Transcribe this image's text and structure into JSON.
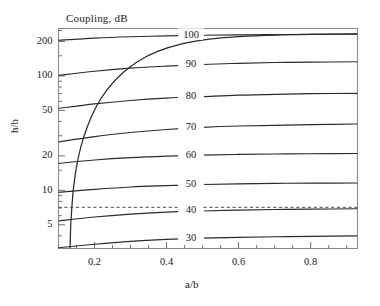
{
  "chart_data": {
    "type": "line",
    "title": "Coupling, dB",
    "xlabel": "a/b",
    "ylabel": "h/b",
    "xscale": "linear",
    "yscale": "log",
    "xlim": [
      0.1,
      0.93
    ],
    "ylim": [
      3.1,
      260
    ],
    "grid": false,
    "legend": null,
    "xticks": [
      0.2,
      0.4,
      0.6,
      0.8
    ],
    "xtick_labels": [
      "0.2",
      "0.4",
      "0.6",
      "0.8"
    ],
    "xminor_ticks": [
      0.1,
      0.15,
      0.25,
      0.3,
      0.35,
      0.45,
      0.5,
      0.55,
      0.65,
      0.7,
      0.75,
      0.85,
      0.9
    ],
    "yticks": [
      5,
      10,
      20,
      50,
      100,
      200
    ],
    "ytick_labels": [
      "5",
      "10",
      "20",
      "50",
      "100",
      "200"
    ],
    "yminor_ticks": [
      4,
      6,
      7,
      8,
      9,
      15,
      30,
      40,
      60,
      70,
      80,
      90,
      150,
      250
    ],
    "contour_labels": [
      "100",
      "90",
      "80",
      "70",
      "60",
      "50",
      "40",
      "30"
    ],
    "contour_label_x": 0.468,
    "series": [
      {
        "name": "100",
        "points": [
          [
            0.1,
            205
          ],
          [
            0.2,
            214
          ],
          [
            0.3,
            220
          ],
          [
            0.4,
            224
          ],
          [
            0.5,
            227
          ],
          [
            0.6,
            229
          ],
          [
            0.7,
            230
          ],
          [
            0.8,
            231
          ],
          [
            0.93,
            232
          ]
        ]
      },
      {
        "name": "90",
        "points": [
          [
            0.1,
            101
          ],
          [
            0.2,
            110
          ],
          [
            0.3,
            117
          ],
          [
            0.4,
            122
          ],
          [
            0.5,
            126
          ],
          [
            0.6,
            129
          ],
          [
            0.7,
            131
          ],
          [
            0.8,
            132
          ],
          [
            0.93,
            133
          ]
        ]
      },
      {
        "name": "80",
        "points": [
          [
            0.1,
            52
          ],
          [
            0.2,
            57
          ],
          [
            0.3,
            61
          ],
          [
            0.4,
            64
          ],
          [
            0.5,
            66
          ],
          [
            0.6,
            68
          ],
          [
            0.7,
            69
          ],
          [
            0.8,
            70
          ],
          [
            0.93,
            70.5
          ]
        ]
      },
      {
        "name": "70",
        "points": [
          [
            0.1,
            26.5
          ],
          [
            0.2,
            29.5
          ],
          [
            0.3,
            32
          ],
          [
            0.4,
            34
          ],
          [
            0.5,
            35.5
          ],
          [
            0.6,
            36.5
          ],
          [
            0.7,
            37
          ],
          [
            0.8,
            37.5
          ],
          [
            0.93,
            38
          ]
        ]
      },
      {
        "name": "60",
        "points": [
          [
            0.1,
            17.2
          ],
          [
            0.2,
            18.4
          ],
          [
            0.3,
            19.3
          ],
          [
            0.4,
            19.9
          ],
          [
            0.5,
            20.3
          ],
          [
            0.6,
            20.6
          ],
          [
            0.7,
            20.8
          ],
          [
            0.8,
            20.9
          ],
          [
            0.93,
            21.0
          ]
        ]
      },
      {
        "name": "50",
        "points": [
          [
            0.1,
            9.6
          ],
          [
            0.2,
            10.2
          ],
          [
            0.3,
            10.7
          ],
          [
            0.4,
            11.0
          ],
          [
            0.5,
            11.25
          ],
          [
            0.6,
            11.4
          ],
          [
            0.7,
            11.5
          ],
          [
            0.8,
            11.55
          ],
          [
            0.93,
            11.6
          ]
        ]
      },
      {
        "name": "40",
        "points": [
          [
            0.1,
            5.4
          ],
          [
            0.2,
            5.85
          ],
          [
            0.3,
            6.2
          ],
          [
            0.4,
            6.45
          ],
          [
            0.5,
            6.6
          ],
          [
            0.6,
            6.72
          ],
          [
            0.7,
            6.8
          ],
          [
            0.8,
            6.85
          ],
          [
            0.93,
            6.9
          ]
        ]
      },
      {
        "name": "30",
        "points": [
          [
            0.1,
            3.15
          ],
          [
            0.2,
            3.38
          ],
          [
            0.3,
            3.58
          ],
          [
            0.4,
            3.72
          ],
          [
            0.5,
            3.82
          ],
          [
            0.6,
            3.88
          ],
          [
            0.7,
            3.93
          ],
          [
            0.8,
            3.96
          ],
          [
            0.93,
            4.0
          ]
        ]
      },
      {
        "name": "cutoff-curve",
        "points": [
          [
            0.132,
            3.1
          ],
          [
            0.134,
            5
          ],
          [
            0.137,
            7
          ],
          [
            0.141,
            10
          ],
          [
            0.15,
            16
          ],
          [
            0.162,
            24
          ],
          [
            0.18,
            36
          ],
          [
            0.205,
            54
          ],
          [
            0.235,
            76
          ],
          [
            0.275,
            104
          ],
          [
            0.32,
            134
          ],
          [
            0.375,
            164
          ],
          [
            0.44,
            190
          ],
          [
            0.52,
            210
          ],
          [
            0.61,
            222
          ],
          [
            0.7,
            228
          ],
          [
            0.8,
            231
          ],
          [
            0.93,
            233
          ]
        ]
      }
    ],
    "reference_lines": [
      {
        "name": "dashed-reference",
        "orientation": "horizontal",
        "value": 7.1,
        "style": "dashed"
      }
    ]
  }
}
